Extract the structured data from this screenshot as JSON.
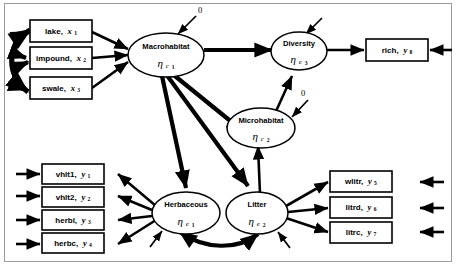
{
  "diagram": {
    "type": "structural-equation-model-path-diagram",
    "latent_variables": [
      {
        "id": "macrohabitat",
        "name": "Macrohabitat",
        "eta": "η",
        "subscript": "c",
        "index": "1"
      },
      {
        "id": "diversity",
        "name": "Diversity",
        "eta": "η",
        "subscript": "e",
        "index": "3"
      },
      {
        "id": "microhabitat",
        "name": "Microhabitat",
        "eta": "η",
        "subscript": "c",
        "index": "2"
      },
      {
        "id": "herbaceous",
        "name": "Herbaceous",
        "eta": "η",
        "subscript": "e",
        "index": "1"
      },
      {
        "id": "litter",
        "name": "Litter",
        "eta": "η",
        "subscript": "e",
        "index": "2"
      }
    ],
    "exogenous_indicators": [
      {
        "id": "lake",
        "label": "lake,",
        "var": "x",
        "sub": "1"
      },
      {
        "id": "impound",
        "label": "impound,",
        "var": "x",
        "sub": "2"
      },
      {
        "id": "swale",
        "label": "swale,",
        "var": "x",
        "sub": "3"
      }
    ],
    "herbaceous_indicators": [
      {
        "id": "vhlt1",
        "label": "vhlt1,",
        "var": "y",
        "sub": "1"
      },
      {
        "id": "vhlt2",
        "label": "vhlt2,",
        "var": "y",
        "sub": "2"
      },
      {
        "id": "herbl",
        "label": "herbl,",
        "var": "y",
        "sub": "3"
      },
      {
        "id": "herbc",
        "label": "herbc,",
        "var": "y",
        "sub": "4"
      }
    ],
    "litter_indicators": [
      {
        "id": "wlitr",
        "label": "wlitr,",
        "var": "y",
        "sub": "5"
      },
      {
        "id": "litrd",
        "label": "litrd,",
        "var": "y",
        "sub": "6"
      },
      {
        "id": "litrc",
        "label": "litrc,",
        "var": "y",
        "sub": "7"
      }
    ],
    "diversity_indicators": [
      {
        "id": "rich",
        "label": "rich,",
        "var": "y",
        "sub": "8"
      }
    ],
    "zero_labels": [
      {
        "id": "zero-macrohabitat",
        "text": "0"
      },
      {
        "id": "zero-microhabitat",
        "text": "0"
      }
    ],
    "colors": {
      "stroke": "#000000",
      "fill": "#ffffff",
      "frame": "#9a9a9a"
    }
  }
}
